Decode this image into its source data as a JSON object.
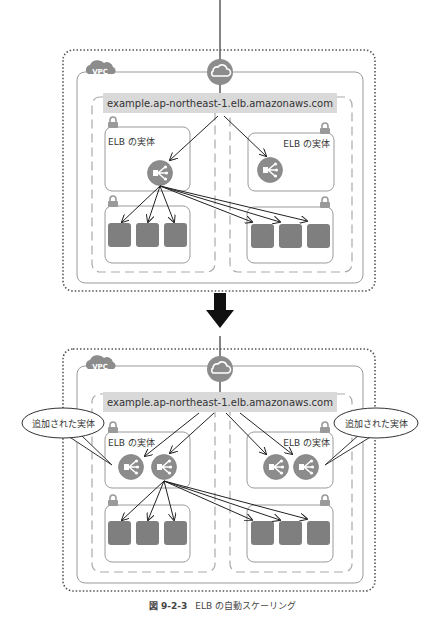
{
  "top_diagram": {
    "vpc_label": "VPC",
    "endpoint_label": "example.ap-northeast-1.elb.amazonaws.com",
    "left_elb_label": "ELB の実体",
    "right_elb_label": "ELB の実体",
    "elb_count_left": 1,
    "elb_count_right": 1,
    "instances_left": 3,
    "instances_right": 3
  },
  "bottom_diagram": {
    "vpc_label": "VPC",
    "endpoint_label": "example.ap-northeast-1.elb.amazonaws.com",
    "left_elb_label": "ELB の実体",
    "right_elb_label": "ELB の実体",
    "elb_count_left": 2,
    "elb_count_right": 2,
    "instances_left": 3,
    "instances_right": 3,
    "callout_left": "追加された実体",
    "callout_right": "追加された実体"
  },
  "caption": {
    "number": "図 9-2-3",
    "text": "ELB の自動スケーリング"
  },
  "colors": {
    "icon_gray": "#8c8c8c",
    "instance_gray": "#7f7f7f",
    "label_bar": "#d9d9d9",
    "border": "#9a9a9a",
    "arrow_black": "#1a1a1a"
  }
}
